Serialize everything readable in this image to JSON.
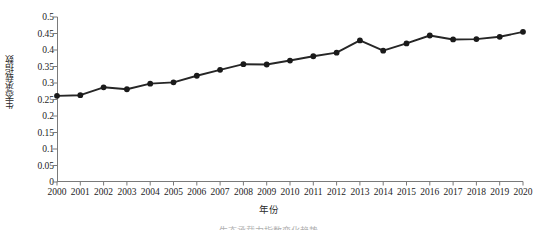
{
  "chart_data": {
    "type": "line",
    "title": "",
    "xlabel": "年份",
    "ylabel": "生态承载指数",
    "xlim": [
      2000,
      2020
    ],
    "ylim": [
      0,
      0.5
    ],
    "grid": false,
    "legend": null,
    "marker": "filled-circle",
    "line_color": "#262626",
    "marker_color": "#1a1a1a",
    "x_tick_labels": [
      "2000",
      "2001",
      "2002",
      "2003",
      "2004",
      "2005",
      "2006",
      "2007",
      "2008",
      "2009",
      "2010",
      "2011",
      "2012",
      "2013",
      "2014",
      "2015",
      "2016",
      "2017",
      "2018",
      "2019",
      "2020"
    ],
    "y_tick_labels": [
      "0.5",
      "0.45",
      "0.4",
      "0.35",
      "0.3",
      "0.25",
      "0.2",
      "0.15",
      "0.1",
      "0.05",
      "0"
    ],
    "y_ticks": [
      0.5,
      0.45,
      0.4,
      0.35,
      0.3,
      0.25,
      0.2,
      0.15,
      0.1,
      0.05,
      0
    ],
    "categories": [
      2000,
      2001,
      2002,
      2003,
      2004,
      2005,
      2006,
      2007,
      2008,
      2009,
      2010,
      2011,
      2012,
      2013,
      2014,
      2015,
      2016,
      2017,
      2018,
      2019,
      2020
    ],
    "values": [
      0.261,
      0.263,
      0.287,
      0.281,
      0.298,
      0.302,
      0.322,
      0.34,
      0.357,
      0.356,
      0.368,
      0.381,
      0.392,
      0.429,
      0.398,
      0.42,
      0.444,
      0.432,
      0.433,
      0.44,
      0.455
    ],
    "series": [
      {
        "name": "生态承载指数",
        "values": [
          0.261,
          0.263,
          0.287,
          0.281,
          0.298,
          0.302,
          0.322,
          0.34,
          0.357,
          0.356,
          0.368,
          0.381,
          0.392,
          0.429,
          0.398,
          0.42,
          0.444,
          0.432,
          0.433,
          0.44,
          0.455
        ]
      }
    ]
  },
  "caption": {
    "text": "生态承载力指数变化趋势"
  }
}
